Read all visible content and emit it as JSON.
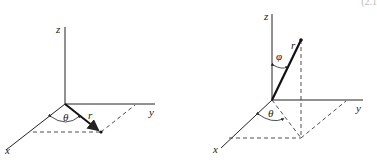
{
  "corner_text": "(2.1",
  "diagrams": [
    {
      "name": "polar-coordinates",
      "labels": {
        "z": "z",
        "y": "y",
        "x": "x",
        "angle": "θ",
        "vector": "r"
      }
    },
    {
      "name": "spherical-coordinates",
      "labels": {
        "z": "z",
        "y": "y",
        "x": "x",
        "azimuth": "θ",
        "polar": "φ",
        "vector": "r"
      }
    }
  ],
  "colors": {
    "line": "#222222",
    "background": "#ffffff"
  }
}
